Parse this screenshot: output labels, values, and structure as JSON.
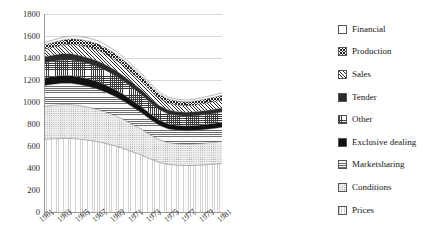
{
  "chart_data": {
    "type": "area",
    "stacked": true,
    "title": "",
    "xlabel": "",
    "ylabel": "",
    "ylim": [
      0,
      1800
    ],
    "ytick_step": 200,
    "grid": true,
    "legend_position": "right",
    "yticks": [
      "1800",
      "1600",
      "1400",
      "1200",
      "1000",
      "800",
      "600",
      "400",
      "200",
      "0"
    ],
    "x": [
      1961,
      1962,
      1963,
      1964,
      1965,
      1966,
      1967,
      1968,
      1969,
      1970,
      1971,
      1972,
      1973,
      1974,
      1975,
      1976,
      1977,
      1978,
      1979,
      1980,
      1981
    ],
    "xtick_labels": [
      "1961",
      "1963",
      "1965",
      "1967",
      "1969",
      "1971",
      "1973",
      "1975",
      "1977",
      "1979",
      "1981"
    ],
    "series": [
      {
        "name": "Prices",
        "pattern": "prices",
        "values": [
          660,
          665,
          668,
          668,
          662,
          652,
          640,
          622,
          600,
          575,
          545,
          515,
          480,
          450,
          432,
          425,
          422,
          424,
          428,
          434,
          440
        ]
      },
      {
        "name": "Conditions",
        "pattern": "conditions",
        "values": [
          300,
          305,
          308,
          308,
          305,
          300,
          294,
          285,
          276,
          264,
          250,
          236,
          220,
          206,
          198,
          195,
          194,
          195,
          197,
          199,
          202
        ]
      },
      {
        "name": "Marketsharing",
        "pattern": "marketsharing",
        "values": [
          190,
          192,
          194,
          194,
          192,
          189,
          185,
          180,
          174,
          166,
          158,
          149,
          139,
          130,
          125,
          123,
          122,
          123,
          124,
          126,
          128
        ]
      },
      {
        "name": "Exclusive dealing",
        "pattern": "exclusive",
        "values": [
          68,
          69,
          70,
          70,
          69,
          68,
          67,
          65,
          63,
          60,
          57,
          54,
          50,
          47,
          45,
          44,
          44,
          44,
          45,
          45,
          46
        ]
      },
      {
        "name": "Other",
        "pattern": "other",
        "values": [
          138,
          140,
          142,
          142,
          140,
          138,
          135,
          131,
          127,
          121,
          115,
          109,
          101,
          95,
          91,
          90,
          89,
          90,
          91,
          92,
          93
        ]
      },
      {
        "name": "Tender",
        "pattern": "tender",
        "values": [
          54,
          55,
          56,
          56,
          55,
          54,
          53,
          52,
          50,
          48,
          45,
          43,
          40,
          37,
          36,
          35,
          35,
          35,
          36,
          36,
          37
        ]
      },
      {
        "name": "Sales",
        "pattern": "sales",
        "values": [
          70,
          72,
          78,
          86,
          92,
          96,
          98,
          97,
          94,
          90,
          85,
          79,
          72,
          66,
          62,
          60,
          60,
          62,
          66,
          70,
          74
        ]
      },
      {
        "name": "Production",
        "pattern": "production",
        "values": [
          40,
          42,
          46,
          50,
          54,
          56,
          57,
          56,
          55,
          52,
          49,
          46,
          42,
          38,
          36,
          35,
          35,
          36,
          38,
          40,
          42
        ]
      },
      {
        "name": "Financial",
        "pattern": "financial",
        "values": [
          20,
          22,
          24,
          26,
          28,
          29,
          30,
          29,
          28,
          27,
          25,
          23,
          21,
          19,
          18,
          17,
          17,
          18,
          19,
          20,
          21
        ]
      }
    ],
    "legend_entries": [
      {
        "label": "Financial",
        "pattern": "financial"
      },
      {
        "label": "Production",
        "pattern": "production"
      },
      {
        "label": "Sales",
        "pattern": "sales"
      },
      {
        "label": "Tender",
        "pattern": "tender"
      },
      {
        "label": "Other",
        "pattern": "other"
      },
      {
        "label": "Exclusive dealing",
        "pattern": "exclusive"
      },
      {
        "label": "Marketsharing",
        "pattern": "marketsharing"
      },
      {
        "label": "Conditions",
        "pattern": "conditions"
      },
      {
        "label": "Prices",
        "pattern": "prices"
      }
    ]
  }
}
